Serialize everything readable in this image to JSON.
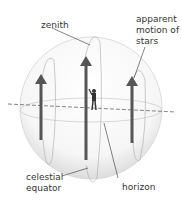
{
  "diagram": {
    "labels": {
      "zenith": "zenith",
      "apparent_motion_1": "apparent",
      "apparent_motion_2": "motion of",
      "apparent_motion_3": "stars",
      "celestial_equator_1": "celestial",
      "celestial_equator_2": "equator",
      "horizon": "horizon"
    },
    "colors": {
      "arrow": "#555555",
      "sphere": "#d8d8d8",
      "leader": "#333333"
    }
  }
}
